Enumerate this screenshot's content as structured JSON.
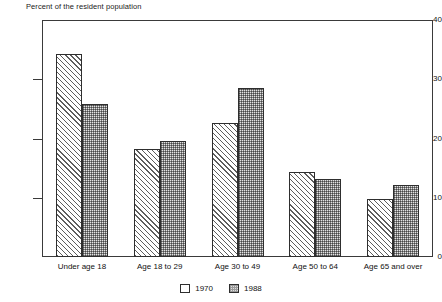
{
  "chart_data": {
    "type": "bar",
    "title": "",
    "ylabel": "Percent of the resident population",
    "xlabel": "",
    "ylim": [
      0,
      40
    ],
    "yticks": [
      0,
      10,
      20,
      30,
      40
    ],
    "ytick_labels": [
      "0",
      "10",
      "20",
      "30",
      "40"
    ],
    "grid": false,
    "legend_position": "bottom-center",
    "categories": [
      "Under age 18",
      "Age 18 to 29",
      "Age 30 to 49",
      "Age 50 to 64",
      "Age 65 and over"
    ],
    "series": [
      {
        "name": "1970",
        "values": [
          34.3,
          18.3,
          22.7,
          14.4,
          9.8
        ]
      },
      {
        "name": "1988",
        "values": [
          25.9,
          19.6,
          28.5,
          13.1,
          12.1
        ]
      }
    ]
  },
  "legend": {
    "items": [
      {
        "label": "1970",
        "pattern": "diagonal-hatch"
      },
      {
        "label": "1988",
        "pattern": "stipple-gray"
      }
    ]
  },
  "colors": {
    "axis": "#3a3a3a",
    "bar_outline": "#2e2e2e",
    "series_1970_fill": "#ffffff",
    "series_1988_fill": "#e3e3e3",
    "background": "#ffffff",
    "text": "#111111"
  }
}
